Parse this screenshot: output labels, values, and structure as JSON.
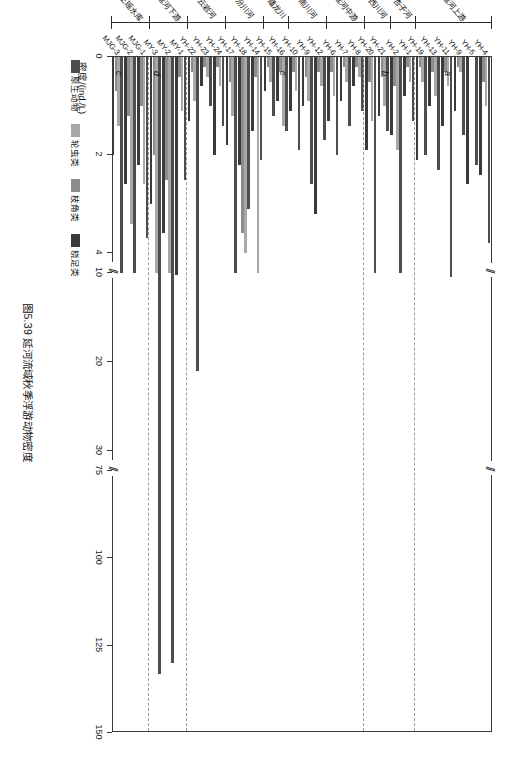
{
  "caption": "图5.39  延河流域秋季浮游动物密度",
  "axis": {
    "x_title": "密度/(ind./L)",
    "x_ticks": [
      "0",
      "2",
      "4",
      "10",
      "20",
      "30",
      "75",
      "100",
      "125",
      "150"
    ],
    "x_break_marks": [
      "//",
      "//"
    ]
  },
  "legend": {
    "items": [
      {
        "label": "原生动物",
        "color": "#4d4d4d"
      },
      {
        "label": "轮虫类",
        "color": "#a8a8a8"
      },
      {
        "label": "枝角类",
        "color": "#8c8c8c"
      },
      {
        "label": "桡足类",
        "color": "#3a3a3a"
      }
    ]
  },
  "panels": [
    {
      "letter": "a"
    },
    {
      "letter": "b"
    },
    {
      "letter": "c"
    },
    {
      "letter": "d"
    },
    {
      "letter": "c"
    }
  ],
  "groups": [
    {
      "label": "延河上游"
    },
    {
      "label": "杏子河"
    },
    {
      "label": "西川河"
    },
    {
      "label": "延河中游"
    },
    {
      "label": "南川河"
    },
    {
      "label": "蟠龙川"
    },
    {
      "label": "汾川河"
    },
    {
      "label": "云岩河"
    },
    {
      "label": "延河下游"
    },
    {
      "label": "王瑶水库"
    },
    {
      "label": "南沟岔"
    }
  ],
  "chart_data": {
    "type": "bar",
    "orientation": "horizontal",
    "title": "图5.39  延河流域秋季浮游动物密度",
    "xlabel": "密度/(ind./L)",
    "ylabel": "",
    "grid": false,
    "legend_position": "below-left",
    "axis_breaks": [
      [
        4,
        10
      ],
      [
        30,
        75
      ]
    ],
    "xlim": [
      0,
      150
    ],
    "series": [
      {
        "name": "原生动物",
        "color": "#4d4d4d"
      },
      {
        "name": "轮虫类",
        "color": "#a8a8a8"
      },
      {
        "name": "枝角类",
        "color": "#8c8c8c"
      },
      {
        "name": "桡足类",
        "color": "#3a3a3a"
      }
    ],
    "categories": [
      "YH-4",
      "YH-5",
      "YH-9",
      "YH-11",
      "YH-13",
      "YH-19",
      "YH-1",
      "YH-2",
      "YH-21",
      "YH-20",
      "YH-8",
      "YH-7",
      "YH-6",
      "YH-12",
      "YH-9",
      "YH-10",
      "YH-16",
      "YH-15",
      "YH-14",
      "YH-18",
      "YH-17",
      "YH-24",
      "YH-23",
      "YH-22",
      "MY-1",
      "MY-2",
      "MY-3",
      "MJG-1",
      "MJG-2",
      "MJG-3"
    ],
    "data": [
      {
        "site": "YH-4",
        "原生动物": 3.8,
        "轮虫类": 1.0,
        "枝角类": 0.5,
        "桡足类": 2.4
      },
      {
        "site": "YH-5",
        "原生动物": 2.2,
        "轮虫类": 0.0,
        "枝角类": 0.0,
        "桡足类": 2.6
      },
      {
        "site": "YH-9",
        "原生动物": 1.6,
        "轮虫类": 0.3,
        "枝角类": 0.2,
        "桡足类": 1.1
      },
      {
        "site": "YH-11",
        "原生动物": 10.5,
        "轮虫类": 0.6,
        "枝角类": 0.3,
        "桡足类": 1.4
      },
      {
        "site": "YH-13",
        "原生动物": 2.3,
        "轮虫类": 0.8,
        "枝角类": 0.3,
        "桡足类": 1.0
      },
      {
        "site": "YH-19",
        "原生动物": 2.0,
        "轮虫类": 0.5,
        "枝角类": 0.2,
        "桡足类": 2.1
      },
      {
        "site": "YH-1",
        "原生动物": 1.3,
        "轮虫类": 0.5,
        "枝角类": 0.2,
        "桡足类": 0.8
      },
      {
        "site": "YH-2",
        "原生动物": 4.3,
        "轮虫类": 1.9,
        "枝角类": 0.6,
        "桡足类": 1.6
      },
      {
        "site": "YH-21",
        "原生动物": 1.5,
        "轮虫类": 1.0,
        "枝角类": 0.4,
        "桡足类": 1.2
      },
      {
        "site": "YH-20",
        "原生动物": 4.2,
        "轮虫类": 1.3,
        "枝角类": 0.5,
        "桡足类": 1.9
      },
      {
        "site": "YH-8",
        "原生动物": 1.1,
        "轮虫类": 0.4,
        "枝角类": 0.2,
        "桡足类": 0.6
      },
      {
        "site": "YH-7",
        "原生动物": 1.4,
        "轮虫类": 0.5,
        "枝角类": 0.2,
        "桡足类": 0.9
      },
      {
        "site": "YH-6",
        "原生动物": 2.0,
        "轮虫类": 0.8,
        "枝角类": 0.3,
        "桡足类": 1.3
      },
      {
        "site": "YH-12",
        "原生动物": 1.7,
        "轮虫类": 0.6,
        "枝角类": 0.3,
        "桡足类": 3.2
      },
      {
        "site": "YH-9b",
        "原生动物": 2.6,
        "轮虫类": 0.9,
        "枝角类": 0.4,
        "桡足类": 1.0
      },
      {
        "site": "YH-10",
        "原生动物": 1.9,
        "轮虫类": 0.7,
        "枝角类": 0.3,
        "桡足类": 1.1
      },
      {
        "site": "YH-16",
        "原生动物": 1.5,
        "轮虫类": 1.4,
        "枝角类": 0.3,
        "桡足类": 0.9
      },
      {
        "site": "YH-15",
        "原生动物": 1.2,
        "轮虫类": 0.5,
        "枝角类": 0.2,
        "桡足类": 0.7
      },
      {
        "site": "YH-14",
        "原生动物": 2.1,
        "轮虫类": 9.2,
        "枝角类": 0.4,
        "桡足类": 1.5
      },
      {
        "site": "YH-18",
        "原生动物": 3.1,
        "轮虫类": 4.0,
        "枝角类": 3.6,
        "桡足类": 2.2
      },
      {
        "site": "YH-17",
        "原生动物": 4.5,
        "轮虫类": 1.2,
        "枝角类": 0.5,
        "桡足类": 1.8
      },
      {
        "site": "YH-24",
        "原生动物": 1.4,
        "轮虫类": 0.6,
        "枝角类": 0.2,
        "桡足类": 2.0
      },
      {
        "site": "YH-23",
        "原生动物": 1.0,
        "轮虫类": 0.4,
        "枝角类": 0.2,
        "桡足类": 0.6
      },
      {
        "site": "YH-22",
        "原生动物": 21.0,
        "轮虫类": 0.9,
        "枝角类": 0.3,
        "桡足类": 1.3
      },
      {
        "site": "MY-1",
        "原生动物": 2.5,
        "轮虫类": 1.1,
        "枝角类": 0.4,
        "桡足类": 10.2
      },
      {
        "site": "MY-2",
        "原生动物": 130.0,
        "轮虫类": 4.5,
        "枝角类": 2.5,
        "桡足类": 3.6
      },
      {
        "site": "MY-3",
        "原生动物": 133.0,
        "轮虫类": 4.8,
        "枝角类": 2.0,
        "桡足类": 3.0
      },
      {
        "site": "MJG-1",
        "原生动物": 3.7,
        "轮虫类": 2.6,
        "枝角类": 1.0,
        "桡足类": 2.2
      },
      {
        "site": "MJG-2",
        "原生动物": 9.0,
        "轮虫类": 3.4,
        "枝角类": 1.2,
        "桡足类": 2.6
      },
      {
        "site": "MJG-3",
        "原生动物": 4.2,
        "轮虫类": 1.4,
        "枝角类": 0.7,
        "桡足类": 2.0
      }
    ]
  }
}
